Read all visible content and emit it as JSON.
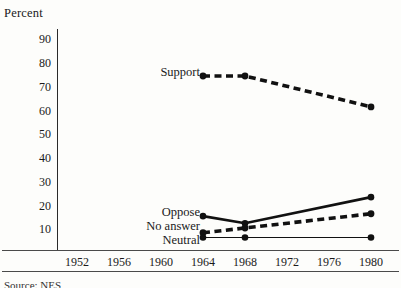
{
  "axis_title": "Percent",
  "source_note": "Source: NES",
  "y_ticks": [
    {
      "label": "90",
      "value": 90
    },
    {
      "label": "80",
      "value": 80
    },
    {
      "label": "70",
      "value": 70
    },
    {
      "label": "60",
      "value": 60
    },
    {
      "label": "50",
      "value": 50
    },
    {
      "label": "40",
      "value": 40
    },
    {
      "label": "30",
      "value": 30
    },
    {
      "label": "20",
      "value": 20
    },
    {
      "label": "10",
      "value": 10
    }
  ],
  "x_ticks": [
    {
      "label": "1952"
    },
    {
      "label": "1956"
    },
    {
      "label": "1960"
    },
    {
      "label": "1964"
    },
    {
      "label": "1968"
    },
    {
      "label": "1972"
    },
    {
      "label": "1976"
    },
    {
      "label": "1980"
    }
  ],
  "series_labels": {
    "support": "Support",
    "oppose": "Oppose",
    "no_answer": "No answer",
    "neutral": "Neutral"
  },
  "chart_data": {
    "type": "line",
    "title": "",
    "subtitle": "",
    "xlabel": "",
    "ylabel": "Percent",
    "grid": false,
    "legend": "inline-right-of-label",
    "xlim": [
      1950,
      1982
    ],
    "ylim": [
      0,
      95
    ],
    "x": [
      1952,
      1956,
      1960,
      1964,
      1968,
      1972,
      1976,
      1980
    ],
    "categories": [
      "1952",
      "1956",
      "1960",
      "1964",
      "1968",
      "1972",
      "1976",
      "1980"
    ],
    "series": [
      {
        "name": "Support",
        "style": "thick-dashed",
        "marker": "filled-circle",
        "color": "#111111",
        "points": [
          {
            "x": 1964,
            "y": 74
          },
          {
            "x": 1968,
            "y": 74
          },
          {
            "x": 1980,
            "y": 61
          }
        ],
        "values": [
          null,
          null,
          null,
          74,
          74,
          null,
          null,
          61
        ]
      },
      {
        "name": "Oppose",
        "style": "thick-solid",
        "marker": "filled-circle",
        "color": "#111111",
        "points": [
          {
            "x": 1964,
            "y": 15
          },
          {
            "x": 1968,
            "y": 12
          },
          {
            "x": 1980,
            "y": 23
          }
        ],
        "values": [
          null,
          null,
          null,
          15,
          12,
          null,
          null,
          23
        ]
      },
      {
        "name": "No answer",
        "style": "thick-dashed",
        "marker": "filled-circle",
        "color": "#111111",
        "points": [
          {
            "x": 1964,
            "y": 8
          },
          {
            "x": 1968,
            "y": 10
          },
          {
            "x": 1980,
            "y": 16
          }
        ],
        "values": [
          null,
          null,
          null,
          8,
          10,
          null,
          null,
          16
        ]
      },
      {
        "name": "Neutral",
        "style": "thin-solid",
        "marker": "filled-circle",
        "color": "#111111",
        "points": [
          {
            "x": 1964,
            "y": 6
          },
          {
            "x": 1968,
            "y": 6
          },
          {
            "x": 1980,
            "y": 6
          }
        ],
        "values": [
          null,
          null,
          null,
          6,
          6,
          null,
          null,
          6
        ]
      }
    ]
  }
}
